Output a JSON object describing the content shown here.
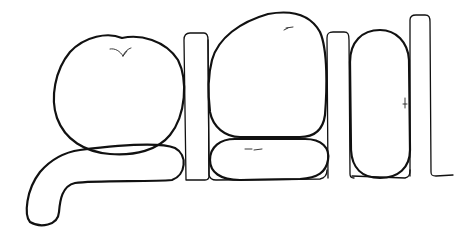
{
  "illustration": {
    "description": "Line drawing of rounded food-like shapes (apple, loaves) arranged between tall narrow slabs",
    "colors": {
      "background": "#ffffff",
      "stroke": "#111111"
    },
    "shapes": [
      {
        "name": "apple",
        "cx": 120,
        "cy": 95
      },
      {
        "name": "hook-loaf",
        "position": "bottom-left"
      },
      {
        "name": "slab-1",
        "x": 184,
        "y": 34
      },
      {
        "name": "rounded-square-loaf",
        "x": 208,
        "y": 12
      },
      {
        "name": "flat-loaf",
        "x": 208,
        "y": 138
      },
      {
        "name": "slab-2",
        "x": 327,
        "y": 32
      },
      {
        "name": "tall-oval-loaf",
        "x": 350,
        "y": 30
      },
      {
        "name": "slab-3",
        "x": 410,
        "y": 15
      }
    ]
  }
}
